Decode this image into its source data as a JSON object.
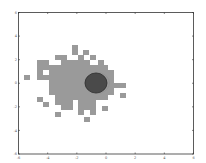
{
  "chart_data": {
    "type": "heatmap",
    "title": "",
    "xlabel": "",
    "ylabel": "",
    "xlim": [
      -6,
      6
    ],
    "ylim": [
      -6,
      6
    ],
    "xticks": [
      "-6",
      "-4",
      "-2",
      "0",
      "2",
      "4",
      "6"
    ],
    "yticks": [
      "6",
      "4",
      "2",
      "0",
      "-2",
      "-4",
      "-6"
    ],
    "grid": false,
    "legend": null,
    "colors": {
      "cells": "#9a9a9a",
      "ellipse_fill": "#4a4a4a",
      "ellipse_edge": "#2e2e2e",
      "axes": "#333333"
    },
    "ellipse": {
      "center": [
        -0.7,
        -0.1
      ],
      "rx": 0.75,
      "ry": 0.85
    },
    "cells_px": [
      [
        72,
        45
      ],
      [
        72,
        50
      ],
      [
        83,
        50
      ],
      [
        55,
        55
      ],
      [
        61,
        55
      ],
      [
        78,
        55
      ],
      [
        90,
        55
      ],
      [
        37,
        60
      ],
      [
        43,
        60
      ],
      [
        61,
        60
      ],
      [
        67,
        60
      ],
      [
        72,
        60
      ],
      [
        78,
        60
      ],
      [
        84,
        60
      ],
      [
        98,
        60
      ],
      [
        37,
        65
      ],
      [
        43,
        65
      ],
      [
        49,
        65
      ],
      [
        55,
        65
      ],
      [
        61,
        65
      ],
      [
        67,
        65
      ],
      [
        72,
        65
      ],
      [
        78,
        65
      ],
      [
        84,
        65
      ],
      [
        90,
        65
      ],
      [
        96,
        65
      ],
      [
        102,
        65
      ],
      [
        37,
        70
      ],
      [
        49,
        70
      ],
      [
        55,
        70
      ],
      [
        61,
        70
      ],
      [
        67,
        70
      ],
      [
        72,
        70
      ],
      [
        78,
        70
      ],
      [
        84,
        70
      ],
      [
        90,
        70
      ],
      [
        96,
        70
      ],
      [
        102,
        70
      ],
      [
        108,
        70
      ],
      [
        24,
        75
      ],
      [
        37,
        75
      ],
      [
        43,
        75
      ],
      [
        49,
        75
      ],
      [
        55,
        75
      ],
      [
        61,
        75
      ],
      [
        67,
        75
      ],
      [
        72,
        75
      ],
      [
        78,
        75
      ],
      [
        84,
        75
      ],
      [
        90,
        75
      ],
      [
        96,
        75
      ],
      [
        102,
        75
      ],
      [
        108,
        75
      ],
      [
        49,
        80
      ],
      [
        55,
        80
      ],
      [
        61,
        80
      ],
      [
        67,
        80
      ],
      [
        72,
        80
      ],
      [
        78,
        80
      ],
      [
        84,
        80
      ],
      [
        90,
        80
      ],
      [
        96,
        80
      ],
      [
        102,
        80
      ],
      [
        108,
        80
      ],
      [
        49,
        85
      ],
      [
        55,
        85
      ],
      [
        61,
        85
      ],
      [
        67,
        85
      ],
      [
        72,
        85
      ],
      [
        78,
        85
      ],
      [
        84,
        85
      ],
      [
        90,
        85
      ],
      [
        96,
        85
      ],
      [
        102,
        85
      ],
      [
        108,
        85
      ],
      [
        114,
        83
      ],
      [
        120,
        83
      ],
      [
        49,
        90
      ],
      [
        55,
        90
      ],
      [
        61,
        90
      ],
      [
        67,
        90
      ],
      [
        72,
        90
      ],
      [
        78,
        90
      ],
      [
        84,
        90
      ],
      [
        90,
        90
      ],
      [
        96,
        90
      ],
      [
        102,
        90
      ],
      [
        108,
        90
      ],
      [
        120,
        93
      ],
      [
        37,
        97
      ],
      [
        55,
        95
      ],
      [
        61,
        95
      ],
      [
        67,
        95
      ],
      [
        72,
        95
      ],
      [
        78,
        95
      ],
      [
        84,
        95
      ],
      [
        90,
        95
      ],
      [
        96,
        95
      ],
      [
        102,
        95
      ],
      [
        43,
        102
      ],
      [
        55,
        100
      ],
      [
        61,
        100
      ],
      [
        67,
        100
      ],
      [
        78,
        100
      ],
      [
        84,
        100
      ],
      [
        90,
        100
      ],
      [
        61,
        105
      ],
      [
        67,
        105
      ],
      [
        78,
        105
      ],
      [
        84,
        105
      ],
      [
        90,
        105
      ],
      [
        102,
        106
      ],
      [
        55,
        112
      ],
      [
        78,
        110
      ],
      [
        90,
        110
      ],
      [
        84,
        117
      ]
    ]
  }
}
